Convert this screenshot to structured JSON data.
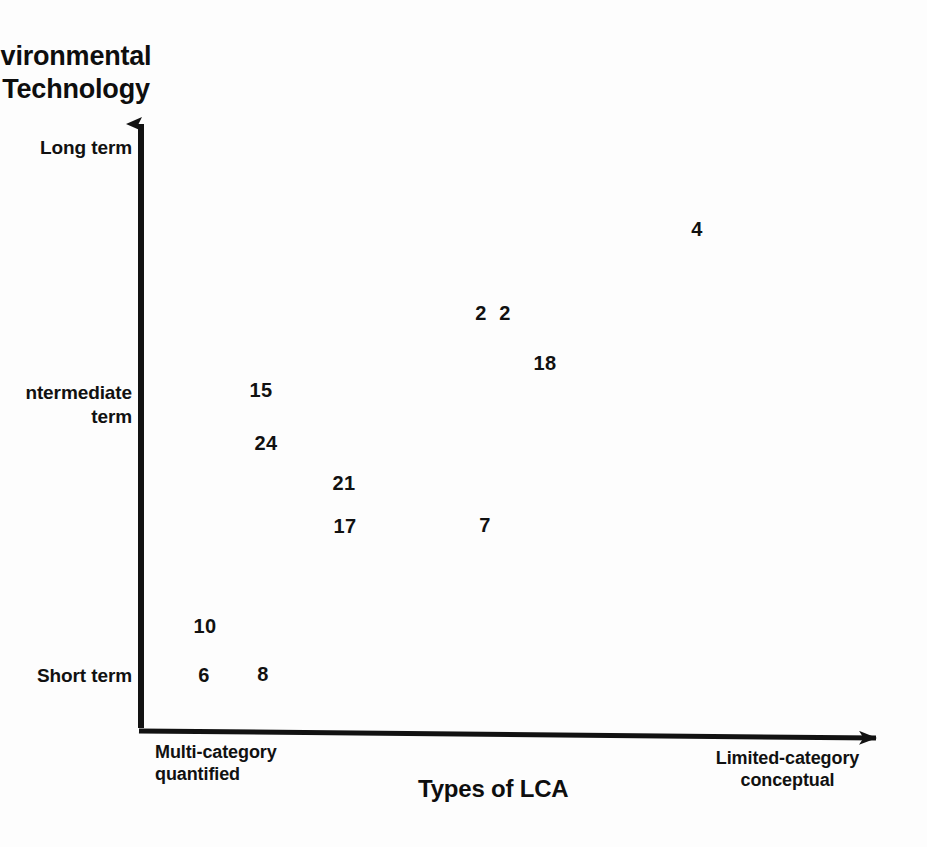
{
  "chart_data": {
    "type": "scatter",
    "title": "",
    "xlabel": "Types of LCA",
    "ylabel": "vironmental\nTechnology",
    "ylabel_note": "label is cropped at the left image edge",
    "xlim": [
      0,
      1
    ],
    "ylim": [
      0,
      1
    ],
    "grid": false,
    "legend": null,
    "x_tick_labels": [
      "Multi-category\nquantified",
      "Limited-category\nconceptual"
    ],
    "y_tick_labels": [
      "Long term",
      "ntermediate\nterm",
      "Short term"
    ],
    "x_axis_direction": "Multi-category quantified (left) to Limited-category conceptual (right)",
    "y_axis_direction": "Short term (bottom) to Long term (top)",
    "point_marker": "numeric-text-label",
    "points": [
      {
        "label": "4",
        "px": 697,
        "py": 229
      },
      {
        "label": "2",
        "px": 481,
        "py": 313
      },
      {
        "label": "2",
        "px": 505,
        "py": 313
      },
      {
        "label": "18",
        "px": 545,
        "py": 363
      },
      {
        "label": "15",
        "px": 261,
        "py": 390
      },
      {
        "label": "24",
        "px": 266,
        "py": 443
      },
      {
        "label": "21",
        "px": 344,
        "py": 483
      },
      {
        "label": "17",
        "px": 345,
        "py": 526
      },
      {
        "label": "7",
        "px": 485,
        "py": 525
      },
      {
        "label": "10",
        "px": 205,
        "py": 626
      },
      {
        "label": "6",
        "px": 204,
        "py": 675
      },
      {
        "label": "8",
        "px": 263,
        "py": 674
      }
    ]
  },
  "axes": {
    "y_title": "vironmental\nTechnology",
    "y_ticks": {
      "long": "Long term",
      "intermediate": "ntermediate\nterm",
      "short": "Short term"
    },
    "x_ticks": {
      "left": "Multi-category\nquantified",
      "right": "Limited-category\nconceptual"
    },
    "x_title": "Types of LCA"
  },
  "colors": {
    "ink": "#111111",
    "background": "#fdfdfd",
    "axis": "#121212"
  }
}
